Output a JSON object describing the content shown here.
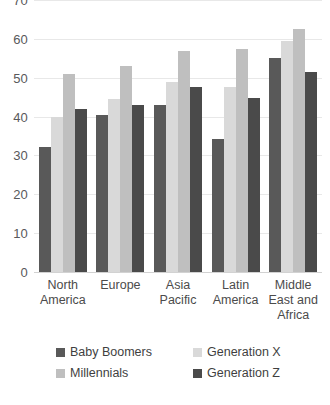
{
  "chart_data": {
    "type": "bar",
    "title": "",
    "xlabel": "",
    "ylabel": "",
    "ylim": [
      0,
      70
    ],
    "yticks": [
      0,
      10,
      20,
      30,
      40,
      50,
      60,
      70
    ],
    "grid": true,
    "legend_position": "bottom",
    "categories": [
      "North America",
      "Europe",
      "Asia Pacific",
      "Latin America",
      "Middle East and Africa"
    ],
    "category_lines": [
      [
        "North",
        "America"
      ],
      [
        "Europe"
      ],
      [
        "Asia",
        "Pacific"
      ],
      [
        "Latin",
        "America"
      ],
      [
        "Middle",
        "East and",
        "Africa"
      ]
    ],
    "series": [
      {
        "name": "Baby Boomers",
        "color": "#595959",
        "values": [
          32.3,
          40.4,
          43.0,
          34.3,
          55.0
        ]
      },
      {
        "name": "Generation X",
        "color": "#d9d9d9",
        "values": [
          40.0,
          44.6,
          49.0,
          47.5,
          59.5
        ]
      },
      {
        "name": "Millennials",
        "color": "#bfbfbf",
        "values": [
          51.0,
          53.0,
          57.0,
          57.5,
          62.5
        ]
      },
      {
        "name": "Generation Z",
        "color": "#4a4a4a",
        "values": [
          42.0,
          43.0,
          47.7,
          44.7,
          51.5
        ]
      }
    ]
  },
  "footer": {
    "cut_text": ""
  }
}
